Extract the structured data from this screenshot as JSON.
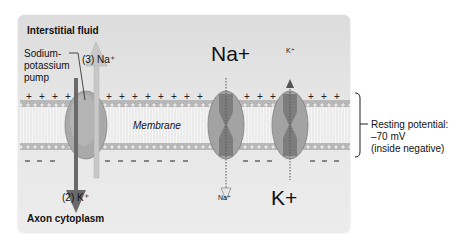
{
  "labels": {
    "interstitial_fluid": "Interstitial fluid",
    "axon_cytoplasm": "Axon cytoplasm",
    "pump_line1": "Sodium-",
    "pump_line2": "potassium",
    "pump_line3": "pump",
    "na_out": "(3) Na⁺",
    "k_in": "(2) K⁺",
    "membrane": "Membrane",
    "na_large": "Na+",
    "k_small": "K⁺",
    "na_small": "Na⁺",
    "k_large": "K+",
    "resting_line1": "Resting potential:",
    "resting_line2": "–70 mV",
    "resting_line3": "(inside negative)"
  },
  "charges": {
    "outside": "+",
    "inside": "–"
  },
  "colors": {
    "panel_bg": "#e4e4e4",
    "membrane_head": "#b5b5b5",
    "channel_fill": "#9a9a9a",
    "k_arrow": "#6a6a6a",
    "na_arrow": "#c4c4c4"
  }
}
